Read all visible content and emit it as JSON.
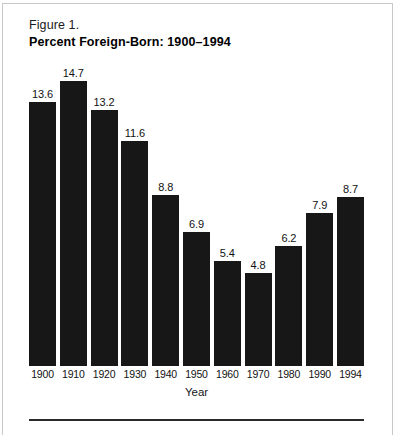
{
  "figure": {
    "title_line_1": "Figure 1.",
    "title_line_2": "Percent  Foreign-Born:  1900–1994"
  },
  "chart_data": {
    "type": "bar",
    "title": "Percent Foreign-Born: 1900–1994",
    "subtitle": "Figure 1.",
    "categories": [
      "1900",
      "1910",
      "1920",
      "1930",
      "1940",
      "1950",
      "1960",
      "1970",
      "1980",
      "1990",
      "1994"
    ],
    "values": [
      13.6,
      14.7,
      13.2,
      11.6,
      8.8,
      6.9,
      5.4,
      4.8,
      6.2,
      7.9,
      8.7
    ],
    "data_labels": [
      "13.6",
      "14.7",
      "13.2",
      "11.6",
      "8.8",
      "6.9",
      "5.4",
      "4.8",
      "6.2",
      "7.9",
      "8.7"
    ],
    "xlabel": "Year",
    "ylabel": "",
    "ylim": [
      0,
      14.7
    ],
    "grid": false,
    "legend": false,
    "bar_color": "#171717",
    "background_color": "#ffffff"
  }
}
